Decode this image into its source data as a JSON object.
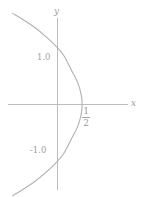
{
  "figure": {
    "width": 145,
    "height": 197,
    "background_color": "#ffffff",
    "axis_color": "#bdbdbd",
    "curve_color": "#b0b0b0",
    "text_color": "#9a9a9a"
  },
  "axes": {
    "y_axis_label": "y",
    "x_axis_label": "x",
    "y_tick_positive_label": "1.0",
    "y_tick_negative_label": "-1.0",
    "x_intercept_numerator": "1",
    "x_intercept_denominator": "2"
  },
  "chart_data": {
    "type": "line",
    "title": "",
    "xlabel": "x",
    "ylabel": "y",
    "grid": false,
    "legend": null,
    "xlim": [
      -1.05,
      1.55
    ],
    "ylim": [
      -1.85,
      1.8
    ],
    "equation": "x = 1/2 - (1/2) y^2",
    "orientation": "opens-left",
    "vertex": [
      0.5,
      0
    ],
    "annotations": [
      {
        "text": "1.0",
        "x": 0,
        "y": 1.0,
        "kind": "y-tick-label"
      },
      {
        "text": "-1.0",
        "x": 0,
        "y": -1.0,
        "kind": "y-tick-label"
      },
      {
        "text": "1/2",
        "x": 0.5,
        "y": 0,
        "kind": "x-intercept-label"
      },
      {
        "text": "y",
        "x": 0,
        "y": 1.8,
        "kind": "axis-name"
      },
      {
        "text": "x",
        "x": 1.55,
        "y": 0,
        "kind": "axis-name"
      }
    ],
    "series": [
      {
        "name": "x = 1/2 - y^2/2",
        "x": [
          -0.9113,
          -0.68,
          -0.4613,
          -0.255,
          -0.0613,
          0.12,
          0.2888,
          0.405,
          0.48,
          0.5,
          0.48,
          0.405,
          0.2888,
          0.12,
          -0.0613,
          -0.255,
          -0.4613,
          -0.68,
          -0.9113
        ],
        "y": [
          -1.75,
          -1.62,
          -1.48,
          -1.32,
          -1.15,
          -0.95,
          -0.65,
          -0.435,
          -0.2,
          0.0,
          0.2,
          0.435,
          0.65,
          0.95,
          1.15,
          1.32,
          1.48,
          1.62,
          1.75
        ]
      }
    ]
  }
}
